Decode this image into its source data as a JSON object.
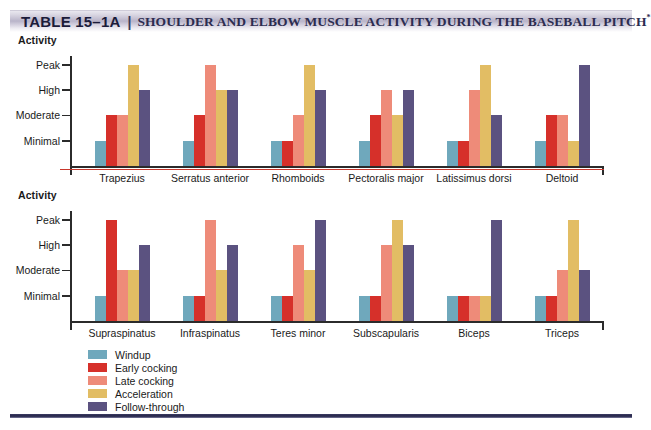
{
  "header": {
    "table_label": "TABLE 15–1A",
    "separator": "|",
    "title": "SHOULDER AND ELBOW MUSCLE ACTIVITY DURING THE BASEBALL PITCH",
    "title_footnote": "*"
  },
  "colors": {
    "windup": "#6FA8BC",
    "early_cocking": "#D6302A",
    "late_cocking": "#EE8B79",
    "acceleration": "#E2BD64",
    "follow_through": "#5B5280",
    "axis": "#2B2B2B",
    "accent_rule": "#C8372C",
    "bottom_rule": "#29294E"
  },
  "legend": {
    "items": [
      {
        "label": "Windup",
        "color_key": "windup"
      },
      {
        "label": "Early cocking",
        "color_key": "early_cocking"
      },
      {
        "label": "Late cocking",
        "color_key": "late_cocking"
      },
      {
        "label": "Acceleration",
        "color_key": "acceleration"
      },
      {
        "label": "Follow-through",
        "color_key": "follow_through"
      }
    ]
  },
  "chart_data": [
    {
      "id": "shoulder-chart",
      "type": "bar",
      "title": "",
      "ylabel": "Activity",
      "xlabel": "",
      "grid": false,
      "legend_position": "bottom-left",
      "ytick_labels": [
        "Peak",
        "High",
        "Moderate",
        "Minimal"
      ],
      "ytick_values": [
        4,
        3,
        2,
        1
      ],
      "ylim": [
        0,
        4.35
      ],
      "categories": [
        "Trapezius",
        "Serratus anterior",
        "Rhomboids",
        "Pectoralis major",
        "Latissimus dorsi",
        "Deltoid"
      ],
      "series": [
        {
          "name": "Windup",
          "color_key": "windup",
          "values": [
            1,
            1,
            1,
            1,
            1,
            1
          ]
        },
        {
          "name": "Early cocking",
          "color_key": "early_cocking",
          "values": [
            2,
            2,
            1,
            2,
            1,
            2
          ]
        },
        {
          "name": "Late cocking",
          "color_key": "late_cocking",
          "values": [
            2,
            4,
            2,
            3,
            3,
            2
          ]
        },
        {
          "name": "Acceleration",
          "color_key": "acceleration",
          "values": [
            4,
            3,
            4,
            2,
            4,
            1
          ]
        },
        {
          "name": "Follow-through",
          "color_key": "follow_through",
          "values": [
            3,
            3,
            3,
            3,
            2,
            4
          ]
        }
      ]
    },
    {
      "id": "rotator-cuff-chart",
      "type": "bar",
      "title": "",
      "ylabel": "Activity",
      "xlabel": "",
      "grid": false,
      "legend_position": "bottom-left",
      "ytick_labels": [
        "Peak",
        "High",
        "Moderate",
        "Minimal"
      ],
      "ytick_values": [
        4,
        3,
        2,
        1
      ],
      "ylim": [
        0,
        4.35
      ],
      "categories": [
        "Supraspinatus",
        "Infraspinatus",
        "Teres minor",
        "Subscapularis",
        "Biceps",
        "Triceps"
      ],
      "series": [
        {
          "name": "Windup",
          "color_key": "windup",
          "values": [
            1,
            1,
            1,
            1,
            1,
            1
          ]
        },
        {
          "name": "Early cocking",
          "color_key": "early_cocking",
          "values": [
            4,
            1,
            1,
            1,
            1,
            1
          ]
        },
        {
          "name": "Late cocking",
          "color_key": "late_cocking",
          "values": [
            2,
            4,
            3,
            3,
            1,
            2
          ]
        },
        {
          "name": "Acceleration",
          "color_key": "acceleration",
          "values": [
            2,
            2,
            2,
            4,
            1,
            4
          ]
        },
        {
          "name": "Follow-through",
          "color_key": "follow_through",
          "values": [
            3,
            3,
            4,
            3,
            4,
            2
          ]
        }
      ]
    }
  ],
  "watermarks": {
    "a": "",
    "b": ""
  }
}
